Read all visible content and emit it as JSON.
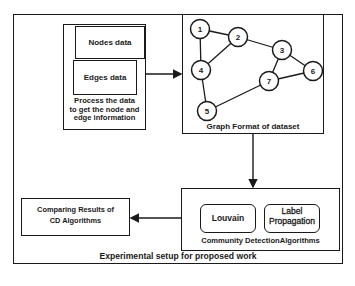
{
  "diagram": {
    "caption": "Experimental setup for proposed work",
    "input_block": {
      "nodes_label": "Nodes data",
      "edges_label": "Edges data",
      "description": "Process the data to get the node and edge information",
      "description_lines": [
        "Process the data",
        "to get the node and",
        "edge information"
      ]
    },
    "graph_block": {
      "caption": "Graph Format of dataset",
      "nodes": [
        {
          "id": "1",
          "x": 200,
          "y": 29
        },
        {
          "id": "2",
          "x": 238,
          "y": 37
        },
        {
          "id": "3",
          "x": 282,
          "y": 50
        },
        {
          "id": "4",
          "x": 201,
          "y": 70
        },
        {
          "id": "5",
          "x": 207,
          "y": 111
        },
        {
          "id": "6",
          "x": 313,
          "y": 71
        },
        {
          "id": "7",
          "x": 269,
          "y": 81
        }
      ],
      "edges": [
        [
          "1",
          "2"
        ],
        [
          "1",
          "4"
        ],
        [
          "2",
          "4"
        ],
        [
          "2",
          "3"
        ],
        [
          "3",
          "7"
        ],
        [
          "3",
          "6"
        ],
        [
          "7",
          "6"
        ],
        [
          "7",
          "5"
        ],
        [
          "4",
          "5"
        ]
      ]
    },
    "algorithms_block": {
      "caption": "Community DetectionAlgorithms",
      "algorithms": [
        "Louvain",
        "Label Propagation"
      ],
      "label_propagation_lines": [
        "Label",
        "Propagation"
      ]
    },
    "results_block": {
      "label_lines": [
        "Comparing Results of",
        "CD Algorithms"
      ]
    },
    "flow": [
      "Process the data to get the node and edge information -> Graph Format of dataset",
      "Graph Format of dataset -> Community DetectionAlgorithms",
      "Community DetectionAlgorithms -> Comparing Results of CD Algorithms"
    ]
  }
}
